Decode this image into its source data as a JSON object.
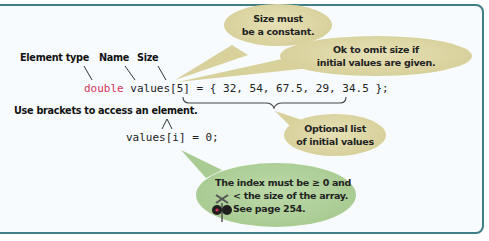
{
  "diagram": {
    "labels": {
      "element_type": "Element type",
      "name": "Name",
      "size": "Size",
      "access": "Use brackets to access an element."
    },
    "code": {
      "declaration_keyword": "double",
      "declaration_rest": " values[5] = { 32, 54, 67.5, 29, 34.5 };",
      "access_line": "values[i] = 0;"
    },
    "callouts": {
      "size_constant": {
        "line1": "Size must",
        "line2": "be a constant."
      },
      "omit_size": {
        "line1": "Ok to omit size if",
        "line2": "initial values are given."
      },
      "optional_list": {
        "line1": "Optional list",
        "line2": "of initial values"
      },
      "index_range": {
        "line1": "The index must be ≥ 0 and",
        "line2": "< the size of the array.",
        "line3": "See page 254."
      }
    },
    "icons": {
      "caution": "railroad-crossing-icon"
    },
    "colors": {
      "border": "#3f7f86",
      "keyword": "#d6335b",
      "tan_bubble": "#d8d19c",
      "green_bubble": "#a9cc93"
    }
  }
}
